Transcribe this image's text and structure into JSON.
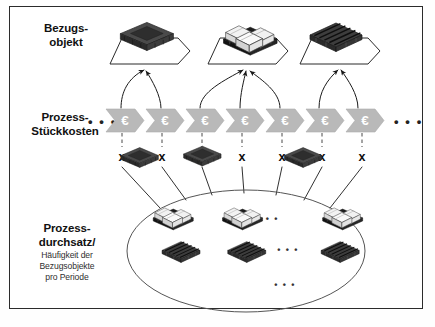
{
  "figure": {
    "title_area": "Prozesskostenrechnung Bezugsobjekt Schema",
    "background_color": "#ffffff",
    "frame_color": "#2b2b2b"
  },
  "rows": {
    "bezugsobjekt": {
      "label_line1": "Bezugs-",
      "label_line2": "objekt",
      "objects": [
        {
          "name": "dark-crate",
          "type": "crate",
          "color": "#3a3a3a"
        },
        {
          "name": "boxed-pallet",
          "type": "boxes-on-pallet",
          "color": "#e8e8e8"
        },
        {
          "name": "wooden-pallet",
          "type": "pallet",
          "color": "#4a4a4a"
        }
      ]
    },
    "prozess_stueckkosten": {
      "label_line1": "Prozess-",
      "label_line2": "Stückkosten",
      "ellipsis_left": "• • •",
      "ellipsis_right": "• • •",
      "chevron_count": 7,
      "chevron_symbol": "€",
      "chevron_fill": "#b8b8b8",
      "chevron_symbol_color": "#ffffff",
      "multiply_symbol": "x",
      "multiply_count": 7
    },
    "prozessdurchsatz": {
      "label_line1": "Prozess-",
      "label_line2": "durchsatz/",
      "sub_line1": "Häufigkeit der",
      "sub_line2": "Bezugsobjekte",
      "sub_line3": "pro Periode",
      "ellipse_stroke": "#555555",
      "groups": [
        {
          "name": "dark-crate-group",
          "items": 3,
          "ellipsis": "• • •"
        },
        {
          "name": "boxed-pallet-group",
          "items": 3,
          "ellipsis": "• • •"
        },
        {
          "name": "wooden-pallet-group",
          "items": 3,
          "ellipsis": "• • •"
        }
      ]
    }
  },
  "connectors": {
    "curved_arrows_count": 7,
    "radial_lines_count": 7,
    "dashed_links_count": 7,
    "stroke_color": "#1a1a1a"
  }
}
